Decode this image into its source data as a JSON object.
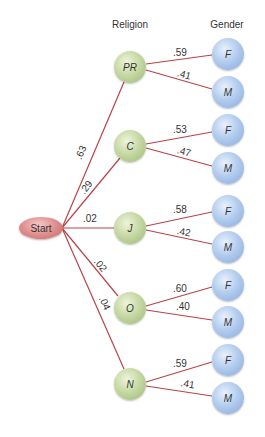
{
  "headers": {
    "religion": "Religion",
    "gender": "Gender"
  },
  "start": {
    "label": "Start"
  },
  "colors": {
    "edge": "#b8444a",
    "religion_node": "#c7d9a4",
    "gender_node": "#b4cdee",
    "start_node": "#df8e8e"
  },
  "religions": [
    {
      "label": "PR",
      "prob": ".63",
      "genders": [
        {
          "label": "F",
          "prob": ".59"
        },
        {
          "label": "M",
          "prob": ".41"
        }
      ]
    },
    {
      "label": "C",
      "prob": ".29",
      "genders": [
        {
          "label": "F",
          "prob": ".53"
        },
        {
          "label": "M",
          "prob": ".47"
        }
      ]
    },
    {
      "label": "J",
      "prob": ".02",
      "genders": [
        {
          "label": "F",
          "prob": ".58"
        },
        {
          "label": "M",
          "prob": ".42"
        }
      ]
    },
    {
      "label": "O",
      "prob": ".02",
      "genders": [
        {
          "label": "F",
          "prob": ".60"
        },
        {
          "label": "M",
          "prob": ".40"
        }
      ]
    },
    {
      "label": "N",
      "prob": ".04",
      "genders": [
        {
          "label": "F",
          "prob": ".59"
        },
        {
          "label": "M",
          "prob": ".41"
        }
      ]
    }
  ]
}
